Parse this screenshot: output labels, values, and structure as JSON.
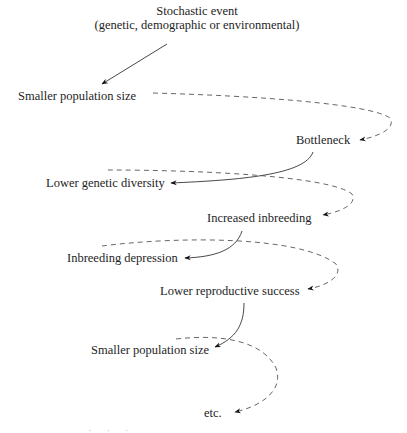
{
  "diagram": {
    "type": "flow-cycle",
    "title_node": {
      "line1": "Stochastic event",
      "line2": "(genetic, demographic or environmental)"
    },
    "nodes": [
      {
        "id": "n1",
        "label": "Smaller population size"
      },
      {
        "id": "n2",
        "label": "Bottleneck"
      },
      {
        "id": "n3",
        "label": "Lower genetic diversity"
      },
      {
        "id": "n4",
        "label": "Increased inbreeding"
      },
      {
        "id": "n5",
        "label": "Inbreeding depression"
      },
      {
        "id": "n6",
        "label": "Lower reproductive success"
      },
      {
        "id": "n7",
        "label": "Smaller population size"
      },
      {
        "id": "n8",
        "label": "etc."
      }
    ],
    "edges": [
      {
        "from": "title",
        "to": "n1",
        "style": "solid"
      },
      {
        "from": "n1",
        "to": "n2",
        "style": "dashed"
      },
      {
        "from": "n2",
        "to": "n3",
        "style": "solid"
      },
      {
        "from": "n3",
        "to": "n4",
        "style": "dashed"
      },
      {
        "from": "n4",
        "to": "n5",
        "style": "solid"
      },
      {
        "from": "n5",
        "to": "n6",
        "style": "dashed"
      },
      {
        "from": "n6",
        "to": "n7",
        "style": "solid"
      },
      {
        "from": "n7",
        "to": "n8",
        "style": "dashed"
      }
    ],
    "footer_fragment": "· · ·"
  }
}
